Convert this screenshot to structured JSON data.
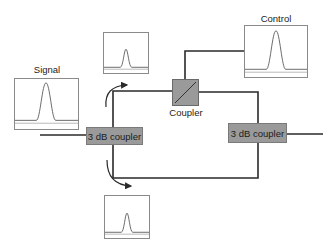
{
  "labels": {
    "signal": "Signal",
    "control": "Control",
    "coupler": "Coupler",
    "left_coupler": "3 dB coupler",
    "right_coupler": "3 dB coupler"
  },
  "colors": {
    "line": "#2a2a2a",
    "coupler_fill": "#9a9a9a",
    "plot_border": "#8a8a8a",
    "pulse": "#555555"
  },
  "plots": [
    {
      "id": "signal",
      "pulse_height": 0.85
    },
    {
      "id": "control",
      "pulse_height": 0.85
    },
    {
      "id": "top-output",
      "pulse_height": 0.45
    },
    {
      "id": "bottom-output",
      "pulse_height": 0.45
    }
  ]
}
